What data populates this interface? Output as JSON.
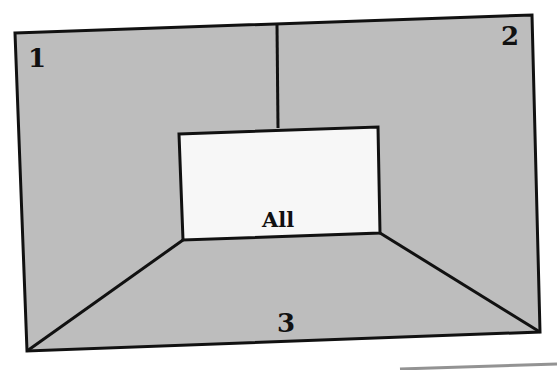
{
  "diagram": {
    "regions": [
      {
        "id": "1",
        "label": "1"
      },
      {
        "id": "2",
        "label": "2"
      },
      {
        "id": "3",
        "label": "3"
      },
      {
        "id": "all",
        "label": "All"
      }
    ]
  },
  "colors": {
    "region_fill": "#bdbdbd",
    "center_fill": "#f7f7f7",
    "stroke": "#111111",
    "text": "#111111"
  }
}
